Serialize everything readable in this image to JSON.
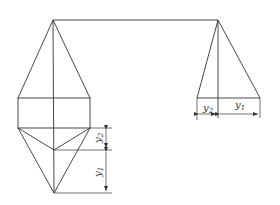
{
  "diagram": {
    "labels": {
      "y1_front": "y",
      "y1_front_sub": "1",
      "y2_front": "y",
      "y2_front_sub": "2",
      "y1_side": "y",
      "y1_side_sub": "1",
      "y2_side": "y",
      "y2_side_sub": "2"
    },
    "colors": {
      "line": "#333333",
      "background": "#ffffff"
    }
  }
}
